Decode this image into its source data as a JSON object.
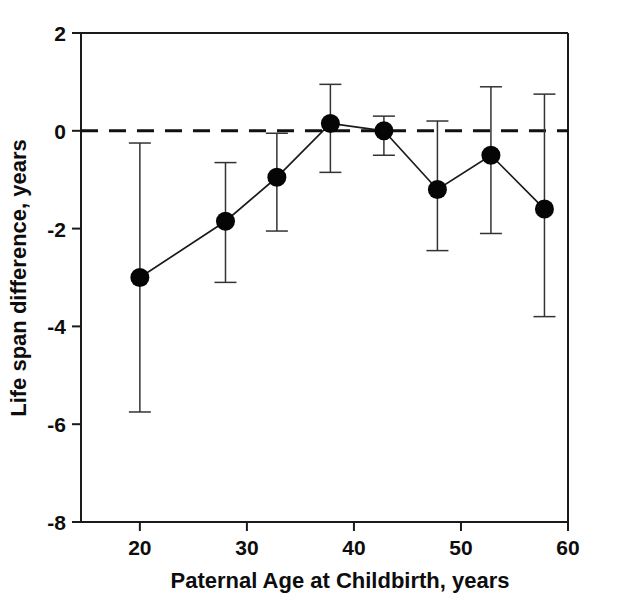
{
  "chart_data": {
    "type": "line",
    "title": "",
    "xlabel": "Paternal Age at Childbirth, years",
    "ylabel": "Life span difference, years",
    "xlim": [
      14.5,
      60
    ],
    "ylim": [
      -8,
      2
    ],
    "xticks": [
      20,
      30,
      40,
      50,
      60
    ],
    "yticks": [
      2,
      0,
      -2,
      -4,
      -6,
      -8
    ],
    "xtick_labels": [
      "20",
      "30",
      "40",
      "50",
      "60"
    ],
    "ytick_labels": [
      "2",
      "0",
      "-2",
      "-4",
      "-6",
      "-8"
    ],
    "grid": false,
    "legend": "none",
    "reference_line": {
      "y": 0,
      "style": "dashed"
    },
    "series": [
      {
        "name": "Life span difference",
        "marker": "filled-circle",
        "x": [
          20.0,
          28.0,
          32.8,
          37.8,
          42.8,
          47.8,
          52.8,
          57.8
        ],
        "values": [
          -3.0,
          -1.85,
          -0.95,
          0.15,
          0.0,
          -1.2,
          -0.5,
          -1.6
        ],
        "error_low": [
          -5.75,
          -3.1,
          -2.05,
          -0.85,
          -0.5,
          -2.45,
          -2.1,
          -3.8
        ],
        "error_high": [
          -0.25,
          -0.65,
          -0.05,
          0.95,
          0.3,
          0.2,
          0.9,
          0.75
        ]
      }
    ]
  }
}
